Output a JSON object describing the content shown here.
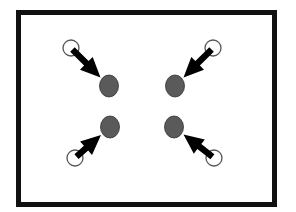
{
  "diagram": {
    "frame": {
      "x": 16,
      "y": 10,
      "width": 261,
      "height": 197,
      "stroke": "#111111",
      "stroke_width": 5
    },
    "colors": {
      "background": "#ffffff",
      "dot_fill": "#5a5a5a",
      "dot_stroke": "#333333",
      "circle_stroke": "#555555",
      "arrow_fill": "#000000"
    },
    "items": [
      {
        "id": "top-left",
        "origin": {
          "x": 71,
          "y": 48
        },
        "target": {
          "x": 109,
          "y": 86
        }
      },
      {
        "id": "top-right",
        "origin": {
          "x": 213,
          "y": 48
        },
        "target": {
          "x": 175,
          "y": 86
        }
      },
      {
        "id": "bottom-left",
        "origin": {
          "x": 75,
          "y": 158
        },
        "target": {
          "x": 110,
          "y": 127
        }
      },
      {
        "id": "bottom-right",
        "origin": {
          "x": 214,
          "y": 158
        },
        "target": {
          "x": 174,
          "y": 127
        }
      }
    ]
  }
}
